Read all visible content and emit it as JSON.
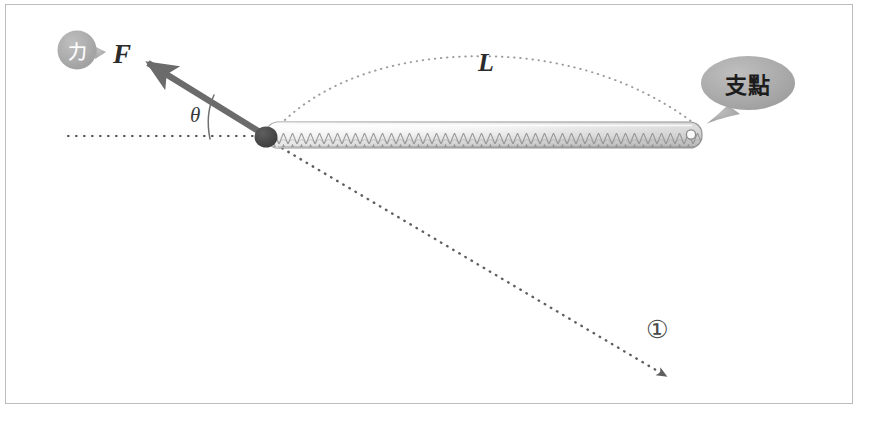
{
  "figure": {
    "background_color": "#ffffff",
    "frame_color": "#bdbdbd"
  },
  "labels": {
    "force_vector": "F",
    "lever_length": "L",
    "angle": "θ",
    "marker_one": "①"
  },
  "callouts": {
    "force_bubble": {
      "text": "力",
      "shape": "circle-speech-bubble",
      "fill": "#a8a8a8",
      "text_color": "#ffffff"
    },
    "fulcrum_bubble": {
      "text": "支點",
      "shape": "oval-speech-bubble",
      "fill": "#a9a9a9",
      "text_color": "#1c1c1c"
    }
  },
  "elements": {
    "lever_bar": {
      "name": "lever-bar",
      "description": "hatched ruler-like bar",
      "fill_top": "#fdfdfd",
      "fill_bottom": "#b4b4b4",
      "outline": "#9a9a9a"
    },
    "pivot_dot": {
      "name": "pivot-point",
      "fill": "#4a4a4a"
    },
    "fulcrum_hole": {
      "name": "fulcrum-hole",
      "fill": "#ffffff",
      "stroke": "#8e8e8e"
    },
    "force_arrow": {
      "name": "force-arrow",
      "color": "#6b6b6b",
      "style": "solid-thick"
    },
    "baseline": {
      "name": "horizontal-reference-line",
      "color": "#555555",
      "style": "dotted"
    },
    "arc_length": {
      "name": "lever-length-arc",
      "color": "#8a8a8a",
      "style": "dotted"
    },
    "direction_line": {
      "name": "line-of-action-extension",
      "color": "#6f6f6f",
      "style": "dotted-with-arrowhead"
    },
    "angle_arc": {
      "name": "angle-arc",
      "color": "#6f6f6f"
    }
  },
  "geometry": {
    "pivot": [
      266,
      137
    ],
    "fulcrum": [
      700,
      134
    ],
    "force_tip": [
      139,
      56
    ],
    "direction_arrow_tip": [
      672,
      381
    ]
  }
}
